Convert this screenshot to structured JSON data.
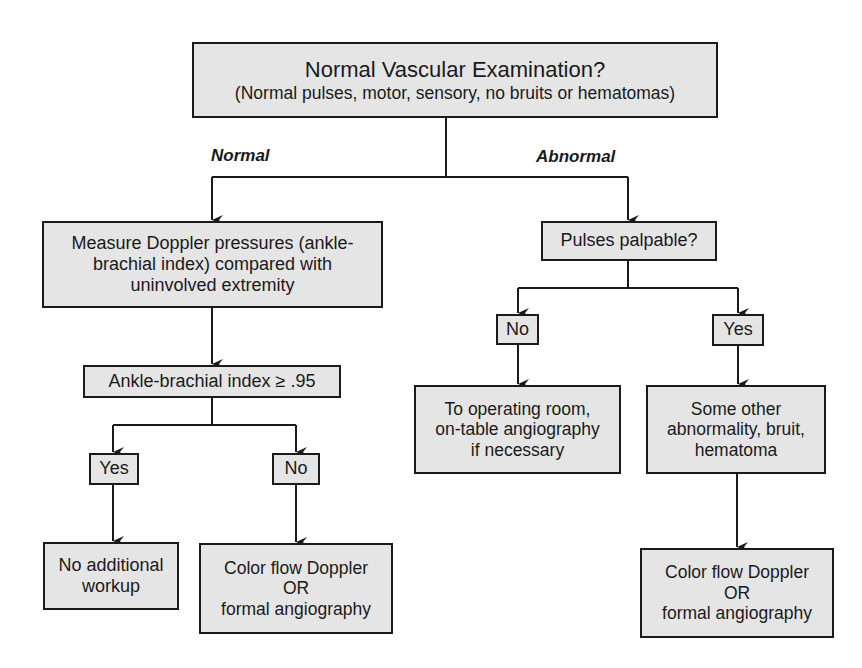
{
  "diagram": {
    "type": "flowchart",
    "root": {
      "title": "Normal Vascular Examination?",
      "subtitle": "(Normal pulses, motor, sensory, no bruits or hematomas)"
    },
    "branch_labels": {
      "normal": "Normal",
      "abnormal": "Abnormal"
    },
    "normal_path": {
      "doppler": {
        "lines": [
          "Measure Doppler pressures (ankle-",
          "brachial index) compared with",
          "uninvolved extremity"
        ]
      },
      "abi_check": {
        "label": "Ankle-brachial index ≥ .95"
      },
      "yes": {
        "label": "Yes",
        "outcome": [
          "No additional",
          "workup"
        ]
      },
      "no": {
        "label": "No",
        "outcome": [
          "Color flow Doppler",
          "OR",
          "formal angiography"
        ]
      }
    },
    "abnormal_path": {
      "pulses": {
        "label": "Pulses palpable?"
      },
      "no": {
        "label": "No",
        "outcome": [
          "To operating room,",
          "on-table angiography",
          "if necessary"
        ]
      },
      "yes": {
        "label": "Yes",
        "finding": [
          "Some other",
          "abnormality, bruit,",
          "hematoma"
        ],
        "outcome": [
          "Color flow Doppler",
          "OR",
          "formal angiography"
        ]
      }
    },
    "colors": {
      "box_fill": "#e5e5e5",
      "line": "#1a1a1a",
      "background": "#ffffff"
    }
  }
}
